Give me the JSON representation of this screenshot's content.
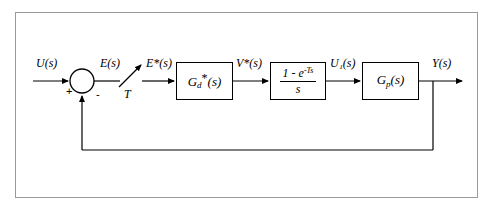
{
  "diagram": {
    "frame_color": "#9a9a9a",
    "line_color": "#000000",
    "background": "#ffffff",
    "signals": {
      "input": "U(s)",
      "error": "E(s)",
      "sampled_error": "E*(s)",
      "controller_output": "V*(s)",
      "hold_output": "U₁(s)",
      "output": "Y(s)",
      "sample_period": "T"
    },
    "summing_junction": {
      "name": "summing-junction",
      "plus_sign": "+",
      "minus_sign": "-"
    },
    "blocks": [
      {
        "id": "digital-controller",
        "label_main": "G",
        "label_sub": "d",
        "label_star": "*",
        "label_arg": "(s)"
      },
      {
        "id": "zero-order-hold",
        "numerator_lead": "1 - ",
        "numerator_e": "e",
        "numerator_exp": "-Ts",
        "denominator": "s"
      },
      {
        "id": "plant",
        "label_main": "G",
        "label_sub": "p",
        "label_arg": "(s)"
      }
    ],
    "sampler": {
      "name": "sampler-switch",
      "label": "T"
    }
  }
}
